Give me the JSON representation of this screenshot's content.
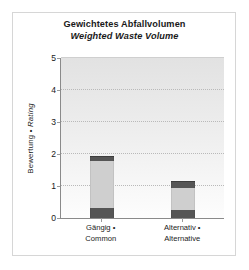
{
  "figure": {
    "title_de": "Gewichtetes Abfallvolumen",
    "title_en": "Weighted Waste Volume"
  },
  "axes": {
    "ylabel_de": "Bewertung",
    "ylabel_separator": "•",
    "ylabel_en": "Rating",
    "yticks": [
      "0",
      "1",
      "2",
      "3",
      "4",
      "5"
    ]
  },
  "categories": [
    {
      "line1": "Gängig •",
      "line2": "Common"
    },
    {
      "line1": "Alternativ •",
      "line2": "Alternative"
    }
  ],
  "colors": {
    "plot_background_top": "#e2e2e2",
    "plot_background_bottom": "#fdfdfd",
    "axis_line": "#8a8a8a",
    "gridline": "#b9b9b9",
    "frame_border": "#d6d6d6",
    "segment_dark": "#555555",
    "segment_light": "#cfcfcf",
    "segment_mid": "#bdbdbd",
    "text": "#1a1a1a"
  },
  "chart_data": {
    "type": "bar",
    "subtype": "stacked",
    "xlabel": "",
    "ylabel": "Bewertung • Rating",
    "ylim": [
      0,
      5
    ],
    "ytick_values": [
      0,
      1,
      2,
      3,
      4,
      5
    ],
    "grid": true,
    "legend": "none",
    "categories": [
      "Gängig • Common",
      "Alternativ • Alternative"
    ],
    "series": [
      {
        "name": "bottom-segment",
        "color": "#555555",
        "values": [
          0.3,
          0.25
        ]
      },
      {
        "name": "middle-segment",
        "color": "#cfcfcf",
        "values": [
          1.48,
          0.7
        ]
      },
      {
        "name": "top-segment",
        "color": "#555555",
        "values": [
          0.15,
          0.22
        ]
      }
    ],
    "totals": [
      1.93,
      1.17
    ],
    "bar_width_fraction": 0.3
  }
}
